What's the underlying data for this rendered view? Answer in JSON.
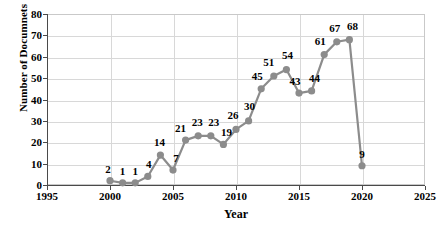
{
  "chart_data": {
    "type": "line",
    "title": "",
    "xlabel": "Year",
    "ylabel": "Number of Documnets",
    "x": [
      2000,
      2001,
      2002,
      2003,
      2004,
      2005,
      2006,
      2007,
      2008,
      2009,
      2010,
      2011,
      2012,
      2013,
      2014,
      2015,
      2016,
      2017,
      2018,
      2019,
      2020
    ],
    "values": [
      2,
      1,
      1,
      4,
      14,
      7,
      21,
      23,
      23,
      19,
      26,
      30,
      45,
      51,
      54,
      43,
      44,
      61,
      67,
      68,
      9
    ],
    "point_labels": [
      "2",
      "1",
      "1",
      "4",
      "14",
      "7",
      "21",
      "23",
      "23",
      "19",
      "26",
      "30",
      "45",
      "51",
      "54",
      "43",
      "44",
      "61",
      "67",
      "68",
      "9"
    ],
    "xlim": [
      1995,
      2025
    ],
    "ylim": [
      0,
      80
    ],
    "xticks": [
      1995,
      2000,
      2005,
      2010,
      2015,
      2020,
      2025
    ],
    "xtick_labels": [
      "1995",
      "2000",
      "2005",
      "2010",
      "2015",
      "2020",
      "2025"
    ],
    "yticks": [
      0,
      10,
      20,
      30,
      40,
      50,
      60,
      70,
      80
    ],
    "ytick_labels": [
      "0",
      "10",
      "20",
      "30",
      "40",
      "50",
      "60",
      "70",
      "80"
    ],
    "grid": true,
    "legend": false,
    "series_color": "#8c8c8c",
    "marker": "circle",
    "marker_size": 6,
    "line_width": 2.2
  }
}
